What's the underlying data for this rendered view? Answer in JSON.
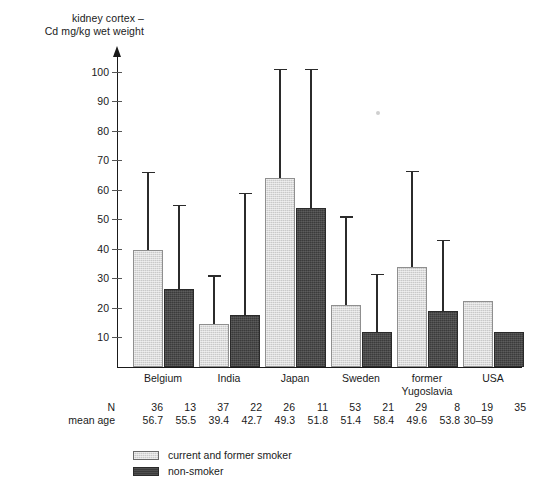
{
  "chart_data": {
    "type": "bar",
    "title": "",
    "ylabel": "kidney cortex –\nCd mg/kg wet weight",
    "xlabel": "",
    "ylim": [
      0,
      105
    ],
    "yticks": [
      10,
      20,
      30,
      40,
      50,
      60,
      70,
      80,
      90,
      100
    ],
    "grid": false,
    "legend_position": "bottom-left",
    "error_bars": "upper whisker only",
    "categories": [
      "Belgium",
      "India",
      "Japan",
      "Sweden",
      "former\nYugoslavia",
      "USA"
    ],
    "series": [
      {
        "name": "current and former smoker",
        "color": "#c9c9c9",
        "values": [
          39.5,
          14.5,
          64.0,
          21.0,
          34.0,
          22.5
        ],
        "error_high": [
          66.0,
          31.0,
          101.0,
          51.0,
          66.5,
          null
        ]
      },
      {
        "name": "non-smoker",
        "color": "#3b3b3b",
        "values": [
          26.5,
          17.5,
          54.0,
          12.0,
          19.0,
          12.0
        ],
        "error_high": [
          55.0,
          59.0,
          101.0,
          31.5,
          43.0,
          null
        ]
      }
    ],
    "annotations": {
      "rows": [
        {
          "label": "N",
          "values": [
            [
              "36",
              "13"
            ],
            [
              "37",
              "22"
            ],
            [
              "26",
              "11"
            ],
            [
              "53",
              "21"
            ],
            [
              "29",
              "8"
            ],
            [
              "19",
              "35"
            ]
          ]
        },
        {
          "label": "mean age",
          "values": [
            [
              "56.7",
              "55.5"
            ],
            [
              "39.4",
              "42.7"
            ],
            [
              "49.3",
              "51.8"
            ],
            [
              "51.4",
              "58.4"
            ],
            [
              "49.6",
              "53.8"
            ],
            [
              "30–59",
              ""
            ]
          ]
        }
      ]
    }
  },
  "axis": {
    "label": "kidney cortex –\nCd mg/kg wet weight",
    "ticks": [
      "100",
      "90",
      "80",
      "70",
      "60",
      "50",
      "40",
      "30",
      "20",
      "10"
    ]
  },
  "categories": [
    {
      "label": "Belgium"
    },
    {
      "label": "India"
    },
    {
      "label": "Japan"
    },
    {
      "label": "Sweden"
    },
    {
      "label": "former\nYugoslavia"
    },
    {
      "label": "USA"
    }
  ],
  "stats": {
    "row_labels": [
      "N",
      "mean age"
    ],
    "n": [
      "36",
      "13",
      "37",
      "22",
      "26",
      "11",
      "53",
      "21",
      "29",
      "8",
      "19",
      "35"
    ],
    "mean_age": [
      "56.7",
      "55.5",
      "39.4",
      "42.7",
      "49.3",
      "51.8",
      "51.4",
      "58.4",
      "49.6",
      "53.8",
      "30–59",
      ""
    ]
  },
  "legend": {
    "items": [
      {
        "label": "current and former smoker",
        "swatch": "light"
      },
      {
        "label": "non-smoker",
        "swatch": "dark"
      }
    ]
  }
}
